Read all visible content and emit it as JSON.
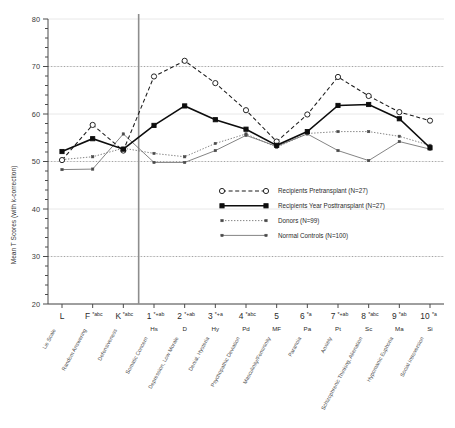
{
  "chart_data": {
    "type": "line",
    "title": "",
    "xlabel": "",
    "ylabel": "Mean T Scores (with k-correction)",
    "ylim": [
      20,
      80
    ],
    "ytick_labels": [
      "20",
      "30",
      "40",
      "50",
      "60",
      "70",
      "80"
    ],
    "ytick_values": [
      20,
      30,
      40,
      50,
      60,
      70,
      80
    ],
    "yminor_step": 2,
    "grid": "dotted horizontal gridlines at 30, 50, 70",
    "legend_position": "center",
    "vertical_divider_after_category": "K*abc",
    "categories": [
      "L",
      "F*abc",
      "K*abc",
      "1*+ab",
      "2*+ab",
      "3*+a",
      "4*abc",
      "5",
      "6*a",
      "7*+ab",
      "8*abc",
      "9*ab",
      "10*a"
    ],
    "category_codes": [
      "L",
      "F",
      "K",
      "1",
      "2",
      "3",
      "4",
      "5",
      "6",
      "7",
      "8",
      "9",
      "10"
    ],
    "category_superscripts": [
      "",
      "*abc",
      "*abc",
      "*+ab",
      "*+ab",
      "*+a",
      "*abc",
      "",
      "*a",
      "*+ab",
      "*abc",
      "*ab",
      "*a"
    ],
    "category_abbreviations": [
      "",
      "",
      "",
      "Hs",
      "D",
      "Hy",
      "Pd",
      "MF",
      "Pa",
      "Pt",
      "Sc",
      "Ma",
      "Si"
    ],
    "category_names": [
      "Lie Scale",
      "Random Answering",
      "Defensiveness",
      "Somatic Concern",
      "Depression, Low Morale",
      "Denial, Hysteria",
      "Psychopathic Deviation",
      "Masculinity/Femininity",
      "Paranoia",
      "Anxiety",
      "Schizophrenic Thinking, Alienation",
      "Hypomanic Euphoria",
      "Social Introversion"
    ],
    "series": [
      {
        "name": "Recipients Pretransplant (N=27)",
        "marker": "open-circle",
        "line": "dashed",
        "values": [
          50.3,
          57.7,
          52.3,
          67.9,
          71.2,
          66.5,
          60.8,
          54.2,
          59.9,
          67.8,
          63.8,
          60.4,
          58.6
        ]
      },
      {
        "name": "Recipients Year Posttransplant (N=27)",
        "marker": "filled-square",
        "line": "solid",
        "values": [
          52.1,
          54.8,
          52.6,
          57.6,
          61.7,
          58.8,
          56.8,
          53.4,
          56.3,
          61.8,
          62.0,
          59.0,
          52.9
        ]
      },
      {
        "name": "Donors (N=99)",
        "marker": "small-dot",
        "line": "dotted",
        "values": [
          50.4,
          51.0,
          52.8,
          51.7,
          51.0,
          53.8,
          55.8,
          53.0,
          55.9,
          56.3,
          56.3,
          55.3,
          53.4
        ]
      },
      {
        "name": "Normal Controls (N=100)",
        "marker": "small-dot",
        "line": "solid-thin",
        "values": [
          48.3,
          48.4,
          55.8,
          49.8,
          49.8,
          52.3,
          55.5,
          53.2,
          55.8,
          52.3,
          50.2,
          54.2,
          52.6
        ]
      }
    ]
  },
  "legend": {
    "entries": [
      "Recipients Pretransplant (N=27)",
      "Recipients Year Posttransplant (N=27)",
      "Donors (N=99)",
      "Normal Controls (N=100)"
    ]
  },
  "axes": {
    "y_title": "Mean T Scores (with k-correction)"
  }
}
